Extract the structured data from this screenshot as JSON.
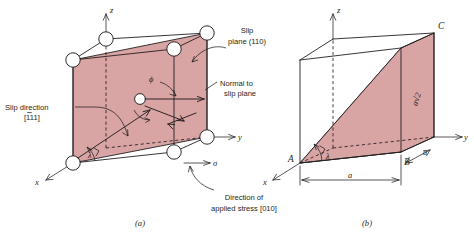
{
  "figure": {
    "colors": {
      "slip_plane_fill": "#d9a4a4",
      "slip_triangle_fill": "#d9a4a4",
      "line": "#231f20",
      "atom_fill": "#ffffff",
      "background": "#ffffff"
    }
  },
  "panel_a": {
    "caption": "(a)",
    "axes": {
      "z": "z",
      "y": "y",
      "x": "x"
    },
    "labels": {
      "slip_plane": {
        "line1": "Slip",
        "line2": "plane (110)"
      },
      "normal_to_slip_plane": {
        "line1": "Normal to",
        "line2": "slip plane"
      },
      "slip_direction": {
        "line1": "Slip direction",
        "line2": "[111]",
        "overbar_first_digit": true
      },
      "applied_stress": {
        "line1": "Direction of",
        "line2": "applied stress [010]"
      },
      "stress_symbol": "σ",
      "angle_phi": "ϕ",
      "angle_lambda": "λ"
    },
    "atom_count": 8
  },
  "panel_b": {
    "caption": "(b)",
    "axes": {
      "z": "z",
      "y": "y",
      "x": "x"
    },
    "vertices": {
      "A": "A",
      "B": "B",
      "C": "C"
    },
    "dimensions": {
      "bottom_edge": "a",
      "right_depth": "a",
      "diagonal": "a√2"
    },
    "labels": {
      "angle_lambda": "λ"
    }
  }
}
